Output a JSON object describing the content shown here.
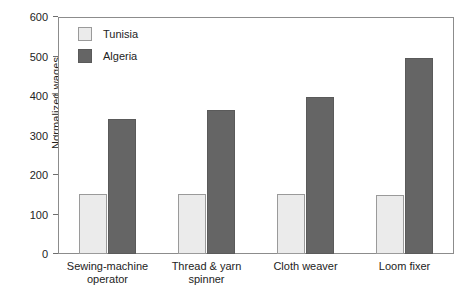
{
  "chart_data": {
    "type": "bar",
    "title": "",
    "subtitle": "",
    "xlabel": "",
    "ylabel": "Normalized wages",
    "ylim": [
      0,
      600
    ],
    "yticks": [
      0,
      100,
      200,
      300,
      400,
      500,
      600
    ],
    "ytick_labels": [
      "0",
      "100",
      "200",
      "300",
      "400",
      "500",
      "600"
    ],
    "grid": false,
    "legend_position": "top-left-inside",
    "categories": [
      "Sewing-machine operator",
      "Thread & yarn spinner",
      "Cloth weaver",
      "Loom fixer"
    ],
    "category_lines": [
      [
        "Sewing-machine",
        "operator"
      ],
      [
        "Thread & yarn",
        "spinner"
      ],
      [
        "Cloth weaver"
      ],
      [
        "Loom fixer"
      ]
    ],
    "series": [
      {
        "name": "Tunisia",
        "color": "#ebebeb",
        "edge_color": "#9a9a9a",
        "values": [
          153,
          153,
          153,
          150
        ]
      },
      {
        "name": "Algeria",
        "color": "#656565",
        "edge_color": "#5a5a5a",
        "values": [
          343,
          364,
          397,
          497
        ]
      }
    ]
  },
  "legend": {
    "items": [
      {
        "label": "Tunisia"
      },
      {
        "label": "Algeria"
      }
    ]
  },
  "axis": {
    "y_title": "Normalized wages",
    "y_labels": [
      "600",
      "500",
      "400",
      "300",
      "200",
      "100",
      "0"
    ]
  },
  "colors": {
    "tunisia": "#ebebeb",
    "algeria": "#656565",
    "frame": "#8c8c8c",
    "text": "#232323",
    "background": "#ffffff"
  }
}
